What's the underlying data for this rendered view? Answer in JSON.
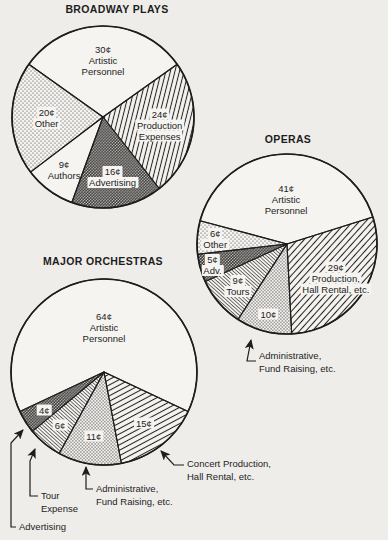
{
  "page": {
    "background": "#efedea",
    "ink": "#1d1d1d",
    "paper_white": "#f6f4f1",
    "value_unit": "cents"
  },
  "chart_data": [
    {
      "id": "broadway-plays",
      "type": "pie",
      "title": "BROADWAY PLAYS",
      "total": 99,
      "center": {
        "x": 103,
        "y": 117
      },
      "radius": 91,
      "start_deg": -54.5,
      "slices": [
        {
          "label": "Artistic Personnel",
          "value": 30,
          "value_text": "30¢",
          "lines": [
            "30¢",
            "Artistic",
            "Personnel"
          ],
          "pattern": "none",
          "label_r": 0.63
        },
        {
          "label": "Production Expenses",
          "value": 24,
          "value_text": "24¢",
          "lines": [
            "24¢",
            "Production",
            "Expenses"
          ],
          "pattern": "hatch-steep",
          "label_r": 0.63
        },
        {
          "label": "Advertising",
          "value": 16,
          "value_text": "16¢",
          "lines": [
            "16¢",
            "Advertising"
          ],
          "pattern": "stipple-dark",
          "label_r": 0.67
        },
        {
          "label": "Authors",
          "value": 9,
          "value_text": "9¢",
          "lines": [
            "9¢",
            "Authors"
          ],
          "pattern": "none",
          "label_r": 0.72
        },
        {
          "label": "Other",
          "value": 20,
          "value_text": "20¢",
          "lines": [
            "20¢",
            "Other"
          ],
          "pattern": "stipple-light",
          "label_r": 0.62
        }
      ]
    },
    {
      "id": "operas",
      "type": "pie",
      "title": "OPERAS",
      "total": 100,
      "center": {
        "x": 287,
        "y": 244
      },
      "radius": 90,
      "start_deg": -75,
      "slices": [
        {
          "label": "Artistic Personnel",
          "value": 41,
          "value_text": "41¢",
          "lines": [
            "41¢",
            "Artistic",
            "Personnel"
          ],
          "pattern": "none",
          "label_r": 0.5
        },
        {
          "label": "Production, Hall Rental, etc.",
          "value": 29,
          "value_text": "29¢",
          "lines": [
            "29¢",
            "Production,",
            "Hall Rental, etc."
          ],
          "pattern": "hatch-diagonal",
          "label_r": 0.66
        },
        {
          "label": "Administrative, Fund Raising, etc.",
          "value": 10,
          "value_text": "10¢",
          "lines": [
            "10¢"
          ],
          "pattern": "stipple-medium",
          "label_r": 0.8
        },
        {
          "label": "Tours",
          "value": 9,
          "value_text": "9¢",
          "lines": [
            "9¢",
            "Tours"
          ],
          "pattern": "hatch-fine",
          "label_r": 0.72
        },
        {
          "label": "Adv.",
          "value": 5,
          "value_text": "5¢",
          "lines": [
            "5¢",
            "Adv."
          ],
          "pattern": "stipple-dark",
          "label_r": 0.86
        },
        {
          "label": "Other",
          "value": 6,
          "value_text": "6¢",
          "lines": [
            "6¢",
            "Other"
          ],
          "pattern": "stipple-light",
          "label_r": 0.8
        }
      ]
    },
    {
      "id": "major-orchestras",
      "type": "pie",
      "title": "MAJOR ORCHESTRAS",
      "total": 100,
      "center": {
        "x": 104,
        "y": 372
      },
      "radius": 93,
      "start_deg": -115.2,
      "slices": [
        {
          "label": "Artistic Personnel",
          "value": 64,
          "value_text": "64¢",
          "lines": [
            "64¢",
            "Artistic",
            "Personnel"
          ],
          "pattern": "none",
          "label_r": 0.48
        },
        {
          "label": "Concert Production, Hall Rental, etc.",
          "value": 15,
          "value_text": "15¢",
          "lines": [
            "15¢"
          ],
          "pattern": "hatch-shallow",
          "label_r": 0.7
        },
        {
          "label": "Administrative, Fund Raising, etc.",
          "value": 11,
          "value_text": "11¢",
          "lines": [
            "11¢"
          ],
          "pattern": "stipple-medium",
          "label_r": 0.7
        },
        {
          "label": "Tour Expense",
          "value": 6,
          "value_text": "6¢",
          "lines": [
            "6¢"
          ],
          "pattern": "hatch-fine",
          "label_r": 0.74
        },
        {
          "label": "Advertising",
          "value": 4,
          "value_text": "4¢",
          "lines": [
            "4¢"
          ],
          "pattern": "stipple-dark",
          "label_r": 0.76
        }
      ]
    }
  ],
  "annotations": [
    {
      "id": "operas-admin",
      "lines": [
        "Administrative,",
        "Fund Raising, etc."
      ],
      "arrow": [
        [
          256,
          361
        ],
        [
          247,
          361
        ],
        [
          251,
          340
        ]
      ]
    },
    {
      "id": "orchestras-concert",
      "lines": [
        "Concert Production,",
        "Hall Rental, etc."
      ],
      "arrow": [
        [
          184,
          465
        ],
        [
          174,
          465
        ],
        [
          161,
          451
        ]
      ]
    },
    {
      "id": "orchestras-admin",
      "lines": [
        "Administrative,",
        "Fund Raising, etc."
      ],
      "arrow": [
        [
          93,
          489
        ],
        [
          86,
          489
        ],
        [
          86,
          467
        ]
      ]
    },
    {
      "id": "orchestras-tour",
      "lines": [
        "Tour",
        "Expense"
      ],
      "arrow": [
        [
          38,
          496
        ],
        [
          30,
          496
        ],
        [
          30,
          461
        ],
        [
          35,
          449
        ]
      ]
    },
    {
      "id": "orchestras-advertising",
      "lines": [
        "Advertising"
      ],
      "arrow": [
        [
          16,
          527
        ],
        [
          11,
          527
        ],
        [
          11,
          443
        ],
        [
          23,
          430
        ]
      ]
    }
  ]
}
